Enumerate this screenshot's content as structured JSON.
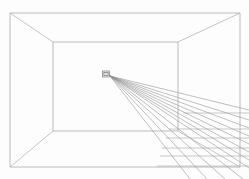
{
  "figure": {
    "width": 249,
    "height": 179,
    "background_color": "#fdfdfd",
    "line_color": "#a8a8a8",
    "ray_color": "#8a8a8a",
    "grid_color": "#9e9e9e",
    "object_color": "#777777"
  },
  "outer_frame": {
    "label": "room-opening-rectangle",
    "x1": 10,
    "y1": 13,
    "x2": 240,
    "y2": 167
  },
  "inner_frame": {
    "label": "back-wall-rectangle",
    "x1": 53,
    "y1": 42,
    "x2": 178,
    "y2": 131
  },
  "corner_diagonals": [
    {
      "name": "top-left-diagonal",
      "x1": 10,
      "y1": 13,
      "x2": 53,
      "y2": 42
    },
    {
      "name": "top-right-diagonal",
      "x1": 240,
      "y1": 13,
      "x2": 178,
      "y2": 42
    },
    {
      "name": "bottom-right-diagonal",
      "x1": 240,
      "y1": 167,
      "x2": 178,
      "y2": 131
    },
    {
      "name": "bottom-left-diagonal",
      "x1": 10,
      "y1": 167,
      "x2": 53,
      "y2": 131
    }
  ],
  "vanishing_point": {
    "label": "vanishing-point-object",
    "x": 106,
    "y": 74,
    "box_width": 7,
    "box_height": 6
  },
  "rays": [
    {
      "x1": 110,
      "y1": 76,
      "x2": 249,
      "y2": 110
    },
    {
      "x1": 110,
      "y1": 76,
      "x2": 249,
      "y2": 120
    },
    {
      "x1": 110,
      "y1": 76,
      "x2": 249,
      "y2": 128
    },
    {
      "x1": 110,
      "y1": 76,
      "x2": 249,
      "y2": 136
    },
    {
      "x1": 110,
      "y1": 76,
      "x2": 249,
      "y2": 144
    },
    {
      "x1": 110,
      "y1": 76,
      "x2": 249,
      "y2": 152
    },
    {
      "x1": 110,
      "y1": 76,
      "x2": 249,
      "y2": 160
    },
    {
      "x1": 110,
      "y1": 76,
      "x2": 249,
      "y2": 168
    },
    {
      "x1": 110,
      "y1": 76,
      "x2": 243,
      "y2": 179
    },
    {
      "x1": 110,
      "y1": 76,
      "x2": 225,
      "y2": 179
    },
    {
      "x1": 110,
      "y1": 76,
      "x2": 207,
      "y2": 179
    },
    {
      "x1": 110,
      "y1": 76,
      "x2": 190,
      "y2": 179
    }
  ],
  "grid_horizontals": [
    {
      "y": 113,
      "x1": 183,
      "x2": 249
    },
    {
      "y": 129,
      "x1": 169,
      "x2": 249
    },
    {
      "y": 138,
      "x1": 166,
      "x2": 249
    },
    {
      "y": 148,
      "x1": 162,
      "x2": 249
    },
    {
      "y": 156,
      "x1": 160,
      "x2": 249
    },
    {
      "y": 166,
      "x1": 157,
      "x2": 249
    }
  ]
}
